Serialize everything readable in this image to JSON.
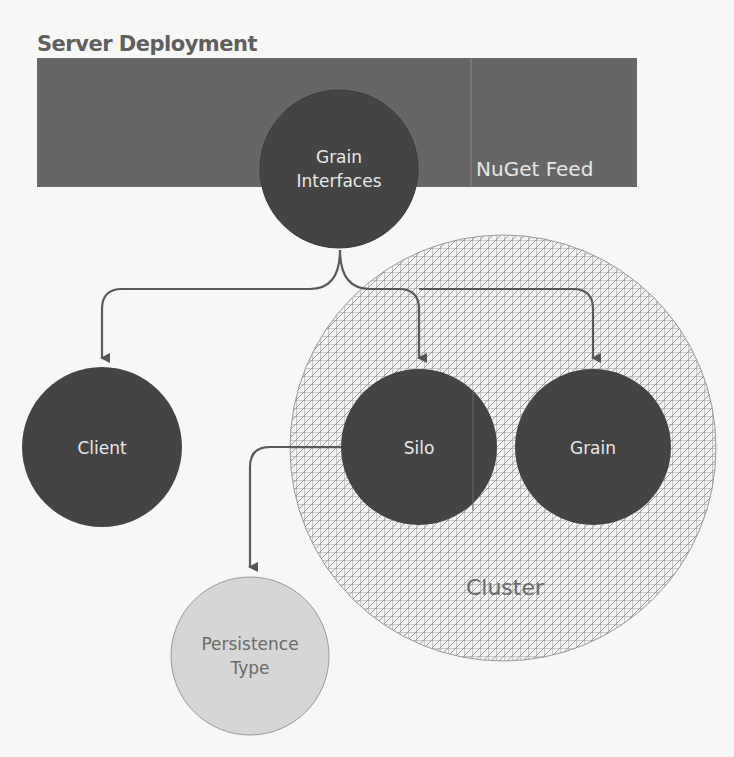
{
  "diagram": {
    "title": "Server Deployment",
    "nuget_label": "NuGet Feed",
    "nodes": {
      "grain_interfaces": {
        "line1": "Grain",
        "line2": "Interfaces"
      },
      "client": {
        "label": "Client"
      },
      "silo": {
        "label": "Silo"
      },
      "grain": {
        "label": "Grain"
      },
      "persistence": {
        "line1": "Persistence",
        "line2": "Type"
      },
      "cluster": {
        "label": "Cluster"
      }
    },
    "edges": [
      {
        "from": "Grain Interfaces",
        "to": "Client"
      },
      {
        "from": "Grain Interfaces",
        "to": "Silo"
      },
      {
        "from": "Grain Interfaces",
        "to": "Grain"
      },
      {
        "from": "Silo",
        "to": "Persistence Type"
      }
    ],
    "colors": {
      "dark_fill": "#444444",
      "rect_fill": "#666666",
      "light_fill": "#d6d6d6",
      "connector": "#5a5a5a",
      "hatch": "#9a9a9a"
    }
  }
}
